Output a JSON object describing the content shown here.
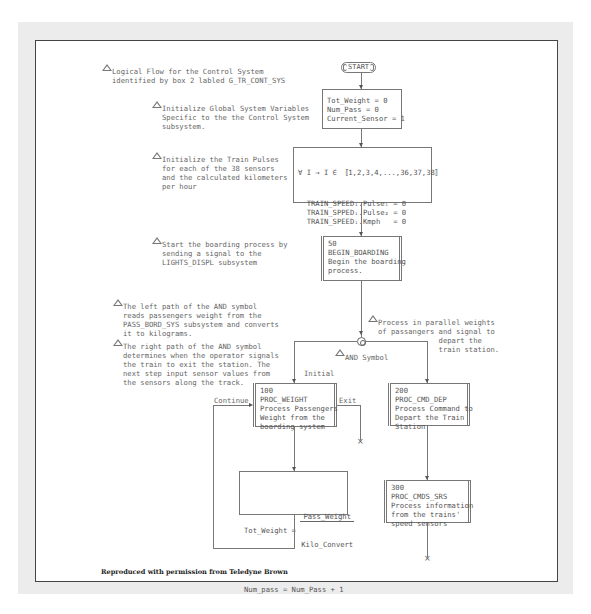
{
  "notes": {
    "title": "Logical Flow for the Control System\nidentified by box 2 labled G_TR_CONT_SYS",
    "init_globals": "Initialize Global System Variables\nSpecific to the the Control System\nsubsystem.",
    "init_pulses": "Initialize the Train Pulses\nfor each of the 38 sensors\nand the calculated kilometers\nper hour",
    "boarding": "Start the boarding process by\nsending a signal to the\nLIGHTS_DISPL subsystem",
    "parallel": "Process in parallel weights\nof passangers and signal to\n              depart the\n              train station.",
    "left_path": "The left path of the AND symbol\nreads passengers weight from the\nPASS_BORD_SYS subsystem and converts\nit to kilograms.",
    "right_path": "The right path of the AND symbol\ndetermines when the operator signals\nthe train to exit the station. The\nnext step input sensor values from\nthe sensors along the track.",
    "and_symbol": "AND Symbol"
  },
  "start": {
    "label": "START"
  },
  "boxes": {
    "globals": "Tot_Weight = 0\nNum_Pass = 0\nCurrent_Sensor = 1",
    "pulses_header": "∀ I → I ∈ 〚1,2,3,4,...,36,37,38〛",
    "pulses_body": "  TRAIN_SPEEDᵢ.Pulseᵢ = 0\n  TRAIN_SPPEDᵢ.Pulse₂ = 0\n  TRAIN_SPEEDᵢ.Kmph   = 0",
    "b50": "50\nBEGIN_BOARDING\nBegin the boarding\nprocess.",
    "b100": "100\nPROC_WEIGHT\nProcess Passengers\nWeight from the\nboarding system",
    "b200": "200\nPROC_CMD_DEP\nProcess Command to\nDepart the Train\nStation",
    "b300": "300\nPROC_CMDS_SRS\nProcess information\nfrom the trains'\nspeed sensors",
    "calc_lhs": "Tot_Weight = ",
    "calc_num": "Pass_Weight",
    "calc_den": "Kilo_Convert",
    "calc_line2": "Num_pass = Num_Pass + 1"
  },
  "edge_labels": {
    "initial": "Initial",
    "continue": "Continue",
    "exit": "Exit"
  },
  "terminators": {
    "x": "×"
  },
  "footer": "Reproduced with permission from Teledyne Brown"
}
